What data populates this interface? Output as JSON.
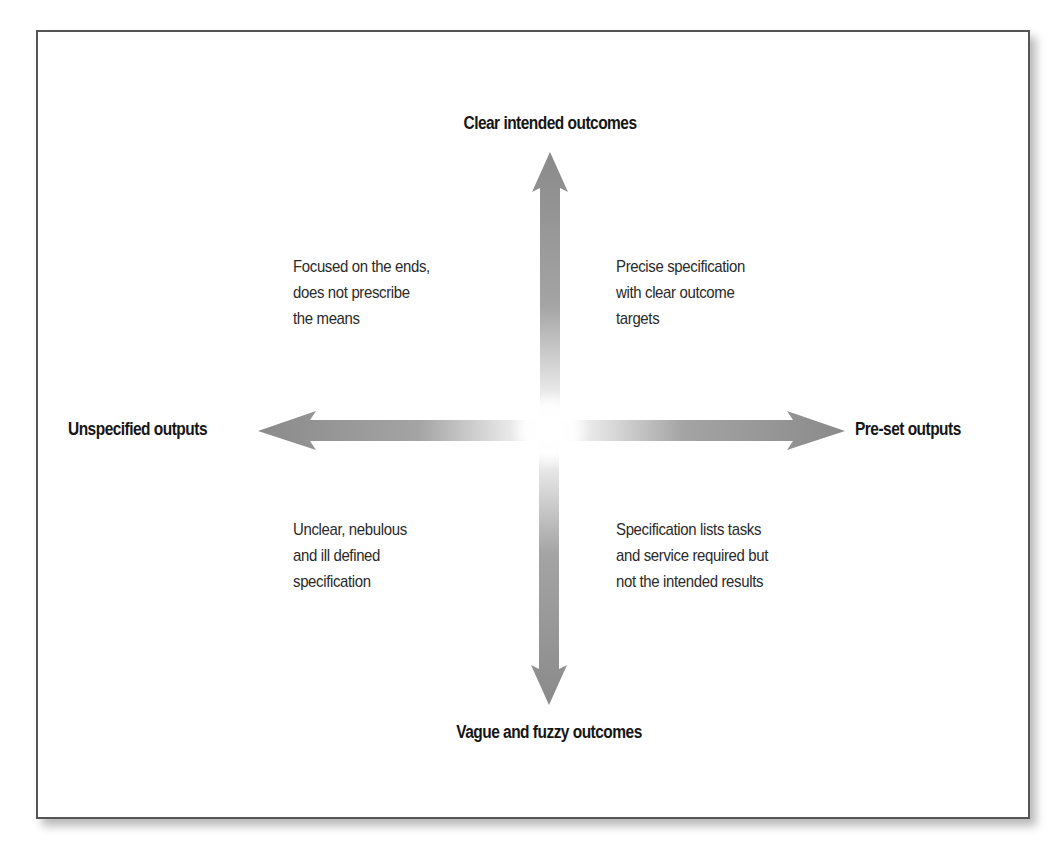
{
  "diagram": {
    "type": "2x2 quadrant matrix",
    "axes": {
      "top": "Clear intended outcomes",
      "bottom": "Vague and fuzzy outcomes",
      "left": "Unspecified outputs",
      "right": "Pre-set outputs"
    },
    "quadrants": {
      "top_left": {
        "lines": [
          "Focused on the ends,",
          "does not prescribe",
          "the means"
        ]
      },
      "top_right": {
        "lines": [
          "Precise specification",
          "with clear outcome",
          "targets"
        ]
      },
      "bottom_left": {
        "lines": [
          "Unclear, nebulous",
          "and ill defined",
          "specification"
        ]
      },
      "bottom_right": {
        "lines": [
          "Specification lists tasks",
          "and service required but",
          "not the intended results"
        ]
      }
    },
    "colors": {
      "arrow": "#8a8a8a",
      "frame_border": "#555555",
      "text": "#1a1a1a"
    }
  }
}
